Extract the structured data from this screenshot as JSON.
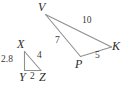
{
  "figure": {
    "type": "geometry-diagram",
    "stroke_color": "#8f8f8f",
    "label_color": "#2b2b2b",
    "background": "#ffffff",
    "width": 126,
    "height": 91
  },
  "triangles": [
    {
      "name": "small-triangle-xyz",
      "vertices": [
        {
          "id": "X",
          "label": "X",
          "x": 24.5,
          "y": 51.5
        },
        {
          "id": "Y",
          "label": "Y",
          "x": 24.5,
          "y": 70.5
        },
        {
          "id": "Z",
          "label": "Z",
          "x": 41.0,
          "y": 70.5
        }
      ],
      "sides": [
        {
          "id": "XY",
          "label": "2.8",
          "value": 2.8
        },
        {
          "id": "XZ",
          "label": "4",
          "value": 4
        },
        {
          "id": "YZ",
          "label": "2",
          "value": 2
        }
      ]
    },
    {
      "name": "large-triangle-vpk",
      "vertices": [
        {
          "id": "V",
          "label": "V",
          "x": 45.5,
          "y": 14.5
        },
        {
          "id": "P",
          "label": "P",
          "x": 80.5,
          "y": 56.5
        },
        {
          "id": "K",
          "label": "K",
          "x": 111.5,
          "y": 47.0
        }
      ],
      "sides": [
        {
          "id": "VP",
          "label": "7",
          "value": 7
        },
        {
          "id": "VK",
          "label": "10",
          "value": 10
        },
        {
          "id": "PK",
          "label": "5",
          "value": 5
        }
      ]
    }
  ],
  "labels": {
    "vertex_X": "X",
    "vertex_Y": "Y",
    "vertex_Z": "Z",
    "vertex_V": "V",
    "vertex_P": "P",
    "vertex_K": "K",
    "len_XY": "2.8",
    "len_XZ": "4",
    "len_YZ": "2",
    "len_VP": "7",
    "len_VK": "10",
    "len_PK": "5"
  }
}
